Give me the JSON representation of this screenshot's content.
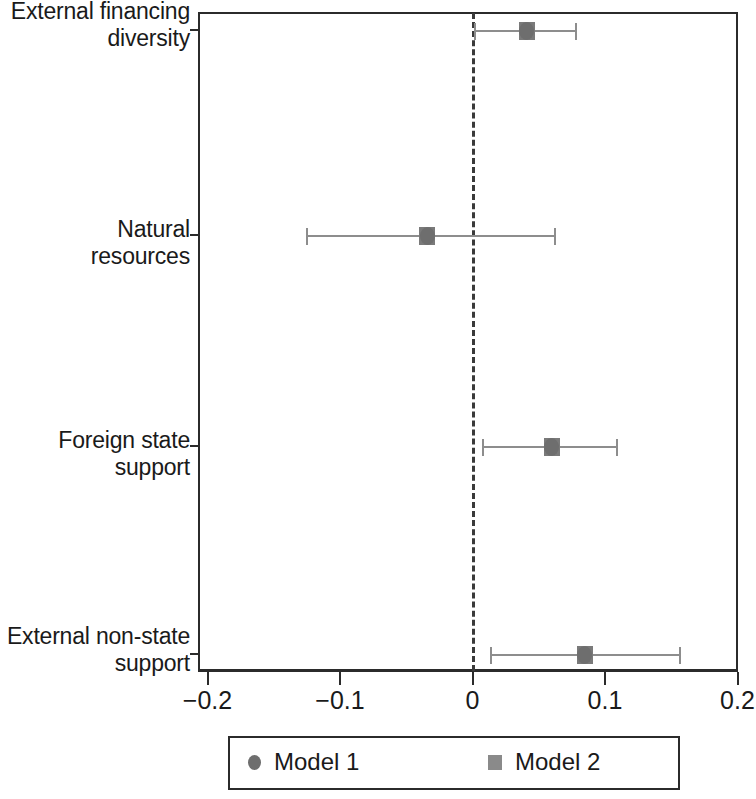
{
  "chart_data": {
    "type": "scatter",
    "title": "",
    "subtitle": "",
    "xlabel": "",
    "ylabel": "",
    "xlim": [
      -0.2,
      0.2
    ],
    "xticks": [
      -0.2,
      -0.1,
      0,
      0.1,
      0.2
    ],
    "xticklabels": [
      "−0.2",
      "−0.1",
      "0",
      "0.1",
      "0.2"
    ],
    "grid": false,
    "reference_line": 0,
    "reference_line_style": "dashed",
    "legend_position": "bottom",
    "categories": [
      "External financing\ndiversity",
      "Natural\nresources",
      "Foreign state\nsupport",
      "External non-state\nsupport"
    ],
    "series": [
      {
        "name": "Model 1",
        "marker": "circle",
        "color": "#6e6e6e",
        "points": [
          {
            "category": "External financing\ndiversity",
            "estimate": 0.04,
            "ci_low": 0.001,
            "ci_high": 0.079
          },
          {
            "category": "Natural\nresources",
            "estimate": -0.034,
            "ci_low": -0.126,
            "ci_high": 0.063
          },
          {
            "category": "Foreign state\nsupport",
            "estimate": 0.059,
            "ci_low": 0.007,
            "ci_high": 0.11
          },
          {
            "category": "External non-state\nsupport",
            "estimate": 0.084,
            "ci_low": 0.013,
            "ci_high": 0.157
          }
        ]
      },
      {
        "name": "Model 2",
        "marker": "square",
        "color": "#7a7a7a",
        "points": [
          {
            "category": "External financing\ndiversity",
            "estimate": 0.041,
            "ci_low": 0.001,
            "ci_high": 0.079
          },
          {
            "category": "Natural\nresources",
            "estimate": -0.034,
            "ci_low": -0.126,
            "ci_high": 0.063
          },
          {
            "category": "Foreign state\nsupport",
            "estimate": 0.06,
            "ci_low": 0.007,
            "ci_high": 0.11
          },
          {
            "category": "External non-state\nsupport",
            "estimate": 0.085,
            "ci_low": 0.013,
            "ci_high": 0.157
          }
        ]
      }
    ]
  },
  "axis": {
    "ylabels": [
      "External financing\ndiversity",
      "Natural\nresources",
      "Foreign state\nsupport",
      "External non-state\nsupport"
    ],
    "xticklabels": [
      "−0.2",
      "−0.1",
      "0",
      "0.1",
      "0.2"
    ]
  },
  "legend": {
    "items": [
      {
        "label": "Model 1",
        "marker": "circle"
      },
      {
        "label": "Model 2",
        "marker": "square"
      }
    ]
  },
  "colors": {
    "marker_model1": "#6e6e6e",
    "marker_model2": "#7a7a7a",
    "error_bar": "#8d8d8d",
    "axis": "#2b2b2b",
    "text": "#1a1a1a",
    "background": "#ffffff"
  }
}
